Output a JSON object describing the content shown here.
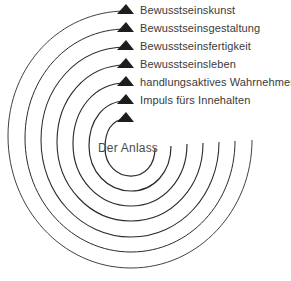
{
  "diagram": {
    "type": "spiral-stage-diagram",
    "center": {
      "label": "Der Anlass"
    },
    "stroke_color": "#2b2b2b",
    "arrow_color": "#1d1d1d",
    "text_color": "#3a3a3a",
    "background_color": "#ffffff",
    "stages": [
      {
        "index": 1,
        "label": "Bewusstseinskunst",
        "arrow": "triangle-up-icon",
        "x": 140,
        "y": 5
      },
      {
        "index": 2,
        "label": "Bewusstseinsgestaltung",
        "arrow": "triangle-up-icon",
        "x": 140,
        "y": 23
      },
      {
        "index": 3,
        "label": "Bewusstseinsfertigkeit",
        "arrow": "triangle-up-icon",
        "x": 140,
        "y": 41
      },
      {
        "index": 4,
        "label": "Bewusstseinsleben",
        "arrow": "triangle-up-icon",
        "x": 140,
        "y": 59
      },
      {
        "index": 5,
        "label": "handlungsaktives Wahrnehmen",
        "arrow": "triangle-up-icon",
        "x": 140,
        "y": 77
      },
      {
        "index": 6,
        "label": "Impuls fürs Innehalten",
        "arrow": "triangle-up-icon",
        "x": 140,
        "y": 95
      },
      {
        "index": 7,
        "label": "",
        "arrow": "triangle-up-icon",
        "x": 140,
        "y": 113
      }
    ]
  }
}
